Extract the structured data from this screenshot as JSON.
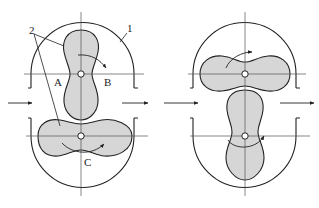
{
  "diagram": {
    "colors": {
      "lobe_fill": "#d6d6d6",
      "stroke": "#222222",
      "centerline": "#555555",
      "background": "#ffffff"
    },
    "left_view": {
      "labels": {
        "casing": "1",
        "rotors": "2",
        "chamber_a": "A",
        "chamber_b": "B",
        "chamber_c": "C"
      },
      "upper_rotor_orientation": "vertical",
      "lower_rotor_orientation": "horizontal"
    },
    "right_view": {
      "upper_rotor_orientation": "horizontal",
      "lower_rotor_orientation": "vertical"
    },
    "flow": {
      "inlet": "left-arrow",
      "outlet": "right-arrow"
    }
  }
}
